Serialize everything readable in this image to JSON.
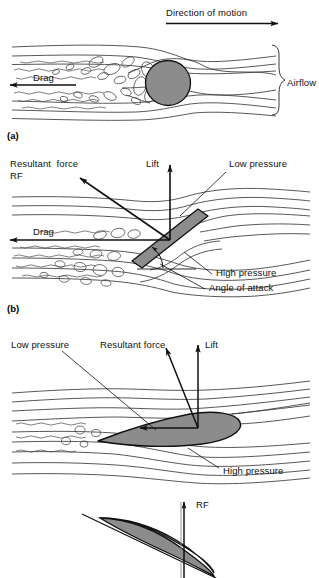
{
  "figure": {
    "title_present": false,
    "background_color": "#ffffff",
    "ink_color": "#1a1a1a",
    "body_fill_color": "#8c8c8c",
    "panels": [
      {
        "tag": "(a)",
        "description": "bluff body (circle) in airflow with turbulent wake",
        "labels": [
          "Direction of motion",
          "Drag",
          "Airflow"
        ]
      },
      {
        "tag": "(b)",
        "description": "inclined flat plate in airflow with force vectors",
        "labels": [
          "Resultant force",
          "RF",
          "Lift",
          "Low pressure",
          "Drag",
          "High pressure",
          "Angle of attack"
        ]
      },
      {
        "tag": "",
        "description": "streamlined aerofoil in airflow with force vectors",
        "labels": [
          "Low pressure",
          "Resultant force",
          "Lift",
          "High pressure"
        ]
      },
      {
        "tag": "",
        "description": "aerofoil section with chord line and resultant force",
        "labels": [
          "RF"
        ]
      }
    ]
  },
  "panel_a": {
    "tag": "(a)",
    "direction_of_motion": "Direction of motion",
    "drag": "Drag",
    "airflow": "Airflow"
  },
  "panel_b": {
    "tag": "(b)",
    "resultant_force_line1": "Resultant  force",
    "resultant_force_line2": "RF",
    "lift": "Lift",
    "low_pressure": "Low pressure",
    "drag": "Drag",
    "high_pressure": "High pressure",
    "angle_of_attack": "Angle of attack"
  },
  "panel_c": {
    "low_pressure": "Low pressure",
    "resultant_force": "Resultant force",
    "lift": "Lift",
    "high_pressure": "High pressure"
  },
  "panel_d": {
    "rf": "RF"
  }
}
